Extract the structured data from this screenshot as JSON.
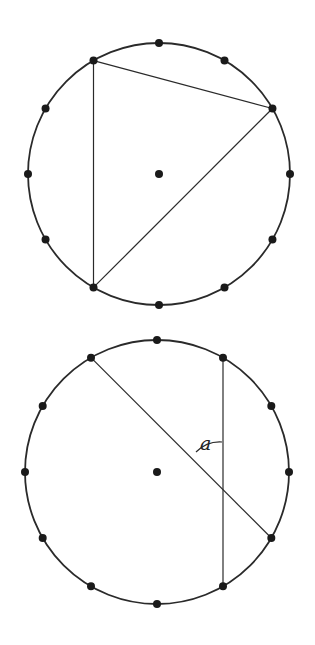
{
  "diagrams": [
    {
      "name": "inscribed-triangle",
      "circle": {
        "cx": 159,
        "cy": 174,
        "r": 131
      },
      "center_dot": true,
      "points_count": 12,
      "chords": [
        [
          11,
          2
        ],
        [
          11,
          7
        ],
        [
          2,
          7
        ]
      ],
      "label": null
    },
    {
      "name": "intersecting-chords",
      "circle": {
        "cx": 157,
        "cy": 472,
        "r": 132
      },
      "center_dot": true,
      "points_count": 12,
      "chords": [
        [
          11,
          4
        ],
        [
          1,
          5
        ]
      ],
      "label": {
        "text": "a",
        "x": 200,
        "y": 452
      }
    }
  ],
  "colors": {
    "stroke": "#2a2a2a",
    "dot": "#1a1a1a",
    "background": "#ffffff"
  },
  "angle_label": "a"
}
